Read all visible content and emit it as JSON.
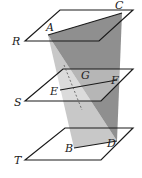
{
  "diagram": {
    "type": "geometry-3d",
    "planes": [
      {
        "label": "R"
      },
      {
        "label": "S"
      },
      {
        "label": "T"
      }
    ],
    "points": [
      {
        "label": "A"
      },
      {
        "label": "B"
      },
      {
        "label": "C"
      },
      {
        "label": "D"
      },
      {
        "label": "E"
      },
      {
        "label": "F"
      },
      {
        "label": "G"
      }
    ],
    "colors": {
      "dark_face": "#8c8c8c",
      "light_face": "#c4c4c4",
      "line": "#1a1a1a"
    }
  }
}
